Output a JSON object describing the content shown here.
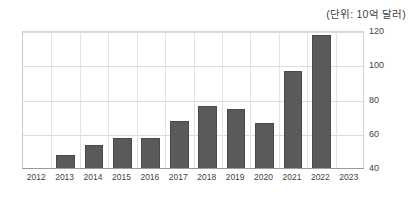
{
  "caption": {
    "unit_label": "(단위: 10억 달러)"
  },
  "chart_data": {
    "type": "bar",
    "title": "",
    "subtitle": "",
    "xlabel": "",
    "ylabel": "",
    "unit_note": "(단위: 10억 달러)",
    "categories": [
      "2012",
      "2013",
      "2014",
      "2015",
      "2016",
      "2017",
      "2018",
      "2019",
      "2020",
      "2021",
      "2022",
      "2023"
    ],
    "x_tick_labels": [
      "2012",
      "2013",
      "2014",
      "2015",
      "2016",
      "2017",
      "2018",
      "2019",
      "2020",
      "2021",
      "2022",
      "2023"
    ],
    "values": [
      null,
      48,
      54,
      58,
      58,
      68,
      77,
      75,
      67,
      97,
      118,
      null
    ],
    "bars": [
      {
        "category": "2012",
        "value": null
      },
      {
        "category": "2013",
        "value": 48
      },
      {
        "category": "2014",
        "value": 54
      },
      {
        "category": "2015",
        "value": 58
      },
      {
        "category": "2016",
        "value": 58
      },
      {
        "category": "2017",
        "value": 68
      },
      {
        "category": "2018",
        "value": 77
      },
      {
        "category": "2019",
        "value": 75
      },
      {
        "category": "2020",
        "value": 67
      },
      {
        "category": "2021",
        "value": 97
      },
      {
        "category": "2022",
        "value": 118
      },
      {
        "category": "2023",
        "value": null
      }
    ],
    "ylim": [
      40,
      120
    ],
    "y_ticks": [
      40,
      60,
      80,
      100,
      120
    ],
    "y_tick_labels": [
      "40",
      "60",
      "80",
      "100",
      "120"
    ],
    "y_axis_position": "right",
    "grid": true,
    "grid_axis": "both",
    "legend": false,
    "legend_position": "none",
    "bar_color": "#5a5a5a",
    "grid_color": "#dcdcdc",
    "axis_color": "#9a9a9a",
    "background_color": "#ffffff"
  }
}
